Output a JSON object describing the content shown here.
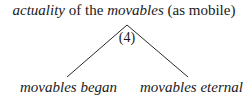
{
  "root": {
    "parts": [
      {
        "text": "actuality",
        "italic": true
      },
      {
        "text": " of the ",
        "italic": false
      },
      {
        "text": "movables",
        "italic": true
      },
      {
        "text": " (as mobile)",
        "italic": false
      }
    ]
  },
  "node_label": "(4)",
  "children": [
    {
      "label": "movables began"
    },
    {
      "label": "movables eternal"
    }
  ],
  "line_color": "#2a2a2a"
}
